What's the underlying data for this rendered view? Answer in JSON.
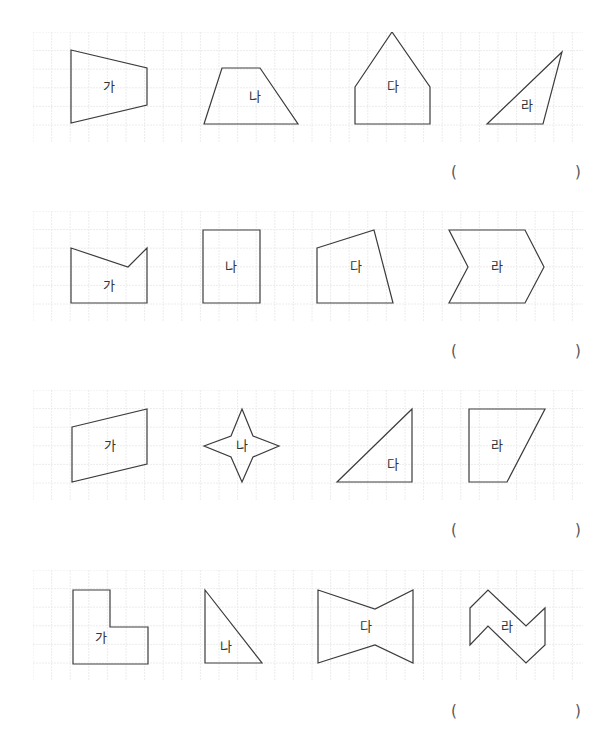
{
  "colors": {
    "grid": "#ececec",
    "outline": "#3c3c3c",
    "label": "#333333",
    "paren": "#555555"
  },
  "grid": {
    "cell": 18.6,
    "cols": 29,
    "rows": 6
  },
  "problems": [
    {
      "shapes": [
        {
          "label": "가",
          "points": "71,50 147,68 147,105 71,123",
          "lx": 109,
          "ly": 91
        },
        {
          "label": "나",
          "points": "204,124 222,68 260,68 298,124",
          "lx": 255,
          "ly": 101
        },
        {
          "label": "다",
          "points": "355,87 392,32 430,87 430,124 355,124",
          "lx": 393,
          "ly": 91
        },
        {
          "label": "라",
          "points": "487,124 562,52 543,124",
          "lx": 527,
          "ly": 110
        }
      ],
      "answer": {
        "open": "(",
        "close": ")",
        "value": ""
      }
    },
    {
      "shapes": [
        {
          "label": "가",
          "points": "71,248 128,267 147,248 147,303 71,303",
          "lx": 109,
          "ly": 290
        },
        {
          "label": "나",
          "points": "203,230 260,230 260,303 203,303",
          "lx": 231,
          "ly": 271
        },
        {
          "label": "다",
          "points": "317,248 374,230 393,303 317,303",
          "lx": 356,
          "ly": 271
        },
        {
          "label": "라",
          "points": "449,230 525,230 544,267 525,303 449,303 468,267",
          "lx": 497,
          "ly": 271
        }
      ],
      "answer": {
        "open": "(",
        "close": ")",
        "value": ""
      }
    },
    {
      "shapes": [
        {
          "label": "가",
          "points": "72,427 147,409 147,464 72,482",
          "lx": 110,
          "ly": 450
        },
        {
          "label": "나",
          "points": "242,409 253,436 279,446 253,457 242,482 231,457 204,446 231,436",
          "lx": 242,
          "ly": 450
        },
        {
          "label": "다",
          "points": "337,482 412,409 412,482",
          "lx": 393,
          "ly": 469
        },
        {
          "label": "라",
          "points": "469,409 545,409 507,482 469,482",
          "lx": 497,
          "ly": 450
        }
      ],
      "answer": {
        "open": "(",
        "close": ")",
        "value": ""
      }
    },
    {
      "shapes": [
        {
          "label": "가",
          "points": "73,590 110,590 110,627 148,627 148,664 73,664",
          "lx": 101,
          "ly": 642
        },
        {
          "label": "나",
          "points": "205,590 262,663 205,663",
          "lx": 226,
          "ly": 651
        },
        {
          "label": "다",
          "points": "318,590 375,609 413,590 413,663 375,645 318,663",
          "lx": 366,
          "ly": 631
        },
        {
          "label": "라",
          "points": "470,608 488,590 526,626 545,608 545,645 526,663 488,626 470,645",
          "lx": 507,
          "ly": 631
        }
      ],
      "answer": {
        "open": "(",
        "close": ")",
        "value": ""
      }
    }
  ],
  "layout": {
    "box_tops": [
      32,
      211,
      390,
      570
    ],
    "paren_tops": [
      163,
      342,
      521,
      702
    ]
  }
}
